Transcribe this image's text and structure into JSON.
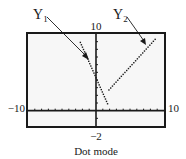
{
  "labels": {
    "y1": "Y",
    "y1_sub": "1",
    "y2": "Y",
    "y2_sub": "2",
    "ymax": "10",
    "ymin": "−2",
    "xmin": "−10",
    "xmax": "10",
    "caption": "Dot mode"
  },
  "window": {
    "xmin": -10,
    "xmax": 10,
    "ymin": -2,
    "ymax": 10,
    "xscl": 1,
    "yscl": 1
  },
  "colors": {
    "ink": "#1a1a1a",
    "screen": "#f7f7f7"
  },
  "chart_data": {
    "type": "scatter",
    "title": "",
    "caption": "Dot mode",
    "xlim": [
      -10,
      10
    ],
    "ylim": [
      -2,
      10
    ],
    "grid": false,
    "series": [
      {
        "name": "Y1",
        "style": "dots",
        "x": [
          -2.3,
          1.7
        ],
        "y": [
          8.9,
          0.9
        ]
      },
      {
        "name": "Y2",
        "style": "dots",
        "x": [
          1.9,
          8.7
        ],
        "y": [
          2.7,
          9.3
        ]
      }
    ]
  }
}
